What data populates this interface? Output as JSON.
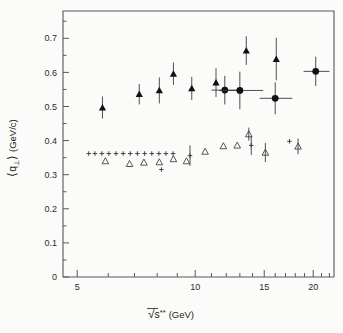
{
  "figure": {
    "background_color": "#fbfbfa",
    "axis_color": "#58585a",
    "marker_color": "#111111"
  },
  "chart_data": {
    "type": "scatter",
    "title": "",
    "subtitle": "",
    "xlabel": "√s** (GeV)",
    "xlabel_parts": {
      "radical": "√",
      "base": "s",
      "sup": "**",
      "unit": "(GeV)"
    },
    "ylabel": "⟨q⊥⟩ (GeV/c)",
    "ylabel_parts": {
      "open": "⟨",
      "sym": "q",
      "sub": "⊥",
      "close": "⟩",
      "unit": "(GeV/c)"
    },
    "xscale": "log",
    "yscale": "linear",
    "xlim": [
      4.6,
      22.6
    ],
    "ylim": [
      0,
      0.78
    ],
    "grid": false,
    "legend": "none",
    "xticks_major": [
      5,
      10,
      15,
      20
    ],
    "xtick_labels": [
      "5",
      "10",
      "15",
      "20"
    ],
    "xticks_minor": [
      6,
      7,
      8,
      9,
      11,
      12,
      13,
      14,
      16,
      17,
      18,
      19,
      21,
      22
    ],
    "yticks_major": [
      0,
      0.1,
      0.2,
      0.3,
      0.4,
      0.5,
      0.6,
      0.7
    ],
    "ytick_labels": [
      "0",
      "0.1",
      "0.2",
      "0.3",
      "0.4",
      "0.5",
      "0.6",
      "0.7"
    ],
    "series": [
      {
        "name": "upper-filled-triangles",
        "marker": "filled-triangle",
        "points": [
          {
            "x": 5.8,
            "y": 0.497,
            "yerr": 0.032,
            "xerr": 0
          },
          {
            "x": 7.2,
            "y": 0.536,
            "yerr": 0.03,
            "xerr": 0
          },
          {
            "x": 8.1,
            "y": 0.547,
            "yerr": 0.038,
            "xerr": 0
          },
          {
            "x": 8.8,
            "y": 0.596,
            "yerr": 0.033,
            "xerr": 0
          },
          {
            "x": 9.8,
            "y": 0.553,
            "yerr": 0.034,
            "xerr": 0
          },
          {
            "x": 11.3,
            "y": 0.57,
            "yerr": 0.042,
            "xerr": 0
          },
          {
            "x": 13.5,
            "y": 0.664,
            "yerr": 0.042,
            "xerr": 0
          },
          {
            "x": 16.1,
            "y": 0.639,
            "yerr": 0.062,
            "xerr": 0
          }
        ]
      },
      {
        "name": "upper-filled-circles",
        "marker": "filled-circle",
        "points": [
          {
            "x": 11.9,
            "y": 0.548,
            "yerr": 0.042,
            "xerr_lo": 0.9,
            "xerr_hi": 1.1
          },
          {
            "x": 13.0,
            "y": 0.547,
            "yerr": 0.055,
            "xerr_lo": 1.5,
            "xerr_hi": 1.9
          },
          {
            "x": 16.0,
            "y": 0.524,
            "yerr": 0.047,
            "xerr_lo": 1.4,
            "xerr_hi": 1.7
          },
          {
            "x": 20.3,
            "y": 0.603,
            "yerr": 0.043,
            "xerr_lo": 1.4,
            "xerr_hi": 1.7
          }
        ]
      },
      {
        "name": "lower-open-triangles",
        "marker": "open-triangle",
        "points": [
          {
            "x": 5.9,
            "y": 0.34,
            "yerr": 0
          },
          {
            "x": 6.8,
            "y": 0.332,
            "yerr": 0
          },
          {
            "x": 7.4,
            "y": 0.336,
            "yerr": 0
          },
          {
            "x": 8.1,
            "y": 0.337,
            "yerr": 0
          },
          {
            "x": 8.8,
            "y": 0.346,
            "yerr": 0
          },
          {
            "x": 9.5,
            "y": 0.34,
            "yerr": 0
          },
          {
            "x": 10.6,
            "y": 0.368,
            "yerr": 0
          },
          {
            "x": 11.8,
            "y": 0.384,
            "yerr": 0
          },
          {
            "x": 12.8,
            "y": 0.386,
            "yerr": 0
          },
          {
            "x": 13.7,
            "y": 0.419,
            "yerr": 0.019
          },
          {
            "x": 15.1,
            "y": 0.365,
            "yerr": 0.028
          },
          {
            "x": 18.3,
            "y": 0.383,
            "yerr": 0.023
          }
        ]
      },
      {
        "name": "lower-plus-markers",
        "marker": "plus",
        "points": [
          {
            "x": 5.35,
            "y": 0.362,
            "yerr": 0
          },
          {
            "x": 5.55,
            "y": 0.362,
            "yerr": 0
          },
          {
            "x": 5.78,
            "y": 0.362,
            "yerr": 0
          },
          {
            "x": 6.02,
            "y": 0.362,
            "yerr": 0
          },
          {
            "x": 6.28,
            "y": 0.362,
            "yerr": 0
          },
          {
            "x": 6.55,
            "y": 0.362,
            "yerr": 0
          },
          {
            "x": 6.83,
            "y": 0.362,
            "yerr": 0
          },
          {
            "x": 7.12,
            "y": 0.362,
            "yerr": 0
          },
          {
            "x": 7.43,
            "y": 0.362,
            "yerr": 0
          },
          {
            "x": 7.75,
            "y": 0.362,
            "yerr": 0
          },
          {
            "x": 8.08,
            "y": 0.362,
            "yerr": 0
          },
          {
            "x": 8.42,
            "y": 0.362,
            "yerr": 0
          },
          {
            "x": 8.78,
            "y": 0.362,
            "yerr": 0
          },
          {
            "x": 8.2,
            "y": 0.315,
            "yerr": 0
          },
          {
            "x": 9.7,
            "y": 0.356,
            "yerr": 0.03
          },
          {
            "x": 13.9,
            "y": 0.386,
            "yerr": 0.028
          },
          {
            "x": 17.4,
            "y": 0.398,
            "yerr": 0
          }
        ]
      }
    ]
  }
}
